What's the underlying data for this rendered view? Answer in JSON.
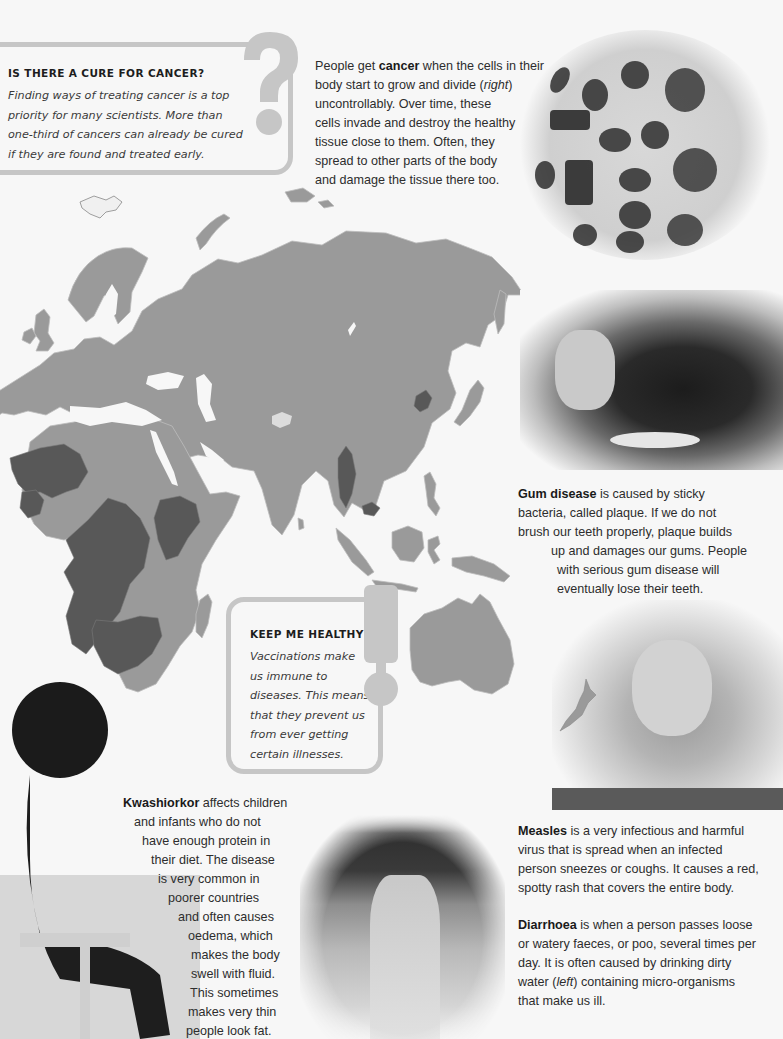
{
  "page": {
    "background_color": "#f7f7f7",
    "accent_gray": "#c6c6c6"
  },
  "cure_box": {
    "icon": "question-mark",
    "title": "IS THERE A CURE FOR CANCER?",
    "lines": [
      "Finding ways of treating cancer is a top",
      "priority for many scientists. More than",
      "one-third of cancers can already be cured",
      "if they are found and treated early."
    ]
  },
  "cancer": {
    "term": "cancer",
    "lines": [
      {
        "pre": "People get ",
        "bold": "cancer",
        "post": " when the cells in their"
      },
      {
        "pre": "body start to grow and divide (",
        "italic": "right",
        "post": ")"
      },
      {
        "pre": "uncontrollably. Over time, these"
      },
      {
        "pre": "cells invade and destroy the healthy"
      },
      {
        "pre": "tissue close to them. Often, they"
      },
      {
        "pre": "spread to other parts of the body"
      },
      {
        "pre": "and damage the tissue there too."
      }
    ],
    "photo_label": "dividing cells micrograph"
  },
  "gum_disease": {
    "term": "Gum disease",
    "lines": [
      {
        "bold": "Gum disease",
        "post": " is caused by sticky"
      },
      {
        "pre": "bacteria, called plaque. If we do not"
      },
      {
        "pre": "brush our teeth properly, plaque builds"
      },
      {
        "pre": "up and damages our gums. People"
      },
      {
        "pre": "with serious gum disease will"
      },
      {
        "pre": "eventually lose their teeth."
      }
    ],
    "photo_label": "dental examination of mouth"
  },
  "health_box": {
    "icon": "exclamation-mark",
    "title": "KEEP ME HEALTHY!",
    "lines": [
      "Vaccinations make",
      "us immune to",
      "diseases. This means",
      "that they prevent us",
      "from ever getting",
      "certain illnesses."
    ]
  },
  "kwashiorkor": {
    "term": "Kwashiorkor",
    "lines": [
      {
        "bold": "Kwashiorkor",
        "post": " affects children"
      },
      {
        "pre": "and infants who do not"
      },
      {
        "pre": "have enough protein in"
      },
      {
        "pre": "their diet. The disease"
      },
      {
        "pre": "is very common in"
      },
      {
        "pre": "poorer countries"
      },
      {
        "pre": "and often causes"
      },
      {
        "pre": "oedema, which"
      },
      {
        "pre": "makes the body"
      },
      {
        "pre": "swell with fluid."
      },
      {
        "pre": "This sometimes"
      },
      {
        "pre": "makes very thin"
      },
      {
        "pre": "people look fat."
      }
    ],
    "photo_label": "child seated on bench"
  },
  "measles": {
    "term": "Measles",
    "lines": [
      {
        "bold": "Measles",
        "post": " is a very infectious and harmful"
      },
      {
        "pre": "virus that is spread when an infected"
      },
      {
        "pre": "person sneezes or coughs. It causes a red,"
      },
      {
        "pre": "spotty rash that covers the entire body."
      }
    ],
    "photo_label": "girl with measles rash"
  },
  "diarrhoea": {
    "term": "Diarrhoea",
    "lines": [
      {
        "bold": "Diarrhoea",
        "post": " is when a person passes loose"
      },
      {
        "pre": "or watery faeces, or poo, several times per"
      },
      {
        "pre": "day. It is often caused by drinking dirty"
      },
      {
        "pre": "water (",
        "italic": "left",
        "post": ") containing micro-organisms"
      },
      {
        "pre": "that make us ill."
      }
    ],
    "photo_label": "river of dirty water"
  },
  "map": {
    "region": "Europe, Asia, Africa and Australia",
    "base_color": "#9a9a9a",
    "highlight_color": "#585858",
    "water_color": "#f7f7f7"
  }
}
